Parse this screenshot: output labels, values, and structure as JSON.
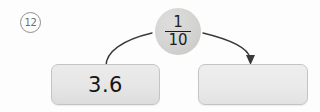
{
  "problem": {
    "number": "12"
  },
  "operator": {
    "icon_name": "fraction-bubble",
    "numerator": "1",
    "denominator": "10",
    "label": "1/10"
  },
  "input_box": {
    "value": "3.6"
  },
  "output_box": {
    "value": "",
    "placeholder": ""
  },
  "connectors": {
    "input_arrow_name": "curve-from-input-to-operator",
    "output_arrow_name": "curve-from-operator-to-output"
  },
  "colors": {
    "bubble_fill": "#d3d3d2",
    "box_fill": "#e6e6e6",
    "box_border": "#c4c4c4",
    "text": "#151515",
    "badge_stroke": "#8e8e8e",
    "connector": "#3a3a3a"
  }
}
